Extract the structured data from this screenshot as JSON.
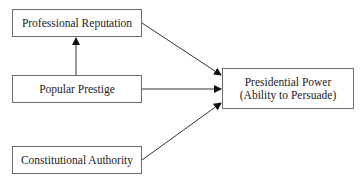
{
  "diagram": {
    "type": "flow",
    "nodes": {
      "professional_reputation": {
        "label": "Professional Reputation"
      },
      "popular_prestige": {
        "label": "Popular Prestige"
      },
      "constitutional_authority": {
        "label": "Constitutional Authority"
      },
      "presidential_power": {
        "line1": "Presidential Power",
        "line2": "(Ability to Persuade)"
      }
    },
    "edges": [
      {
        "from": "popular_prestige",
        "to": "professional_reputation"
      },
      {
        "from": "professional_reputation",
        "to": "presidential_power"
      },
      {
        "from": "popular_prestige",
        "to": "presidential_power"
      },
      {
        "from": "constitutional_authority",
        "to": "presidential_power"
      }
    ],
    "colors": {
      "line": "#333333",
      "border": "#6a6a6a",
      "background": "#ffffff"
    }
  }
}
